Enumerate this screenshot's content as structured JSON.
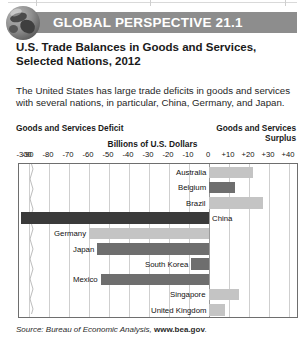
{
  "header": {
    "badge_title": "GLOBAL PERSPECTIVE 21.1",
    "globe_icon": "globe-icon"
  },
  "figure": {
    "title": "U.S. Trade Balances in Goods and Services, Selected Nations, 2012",
    "description": "The United States has large trade deficits in goods and services with several nations, in particular, China, Germany, and Japan.",
    "left_caption": "Goods and Services Deficit",
    "right_caption": "Goods and Services Surplus",
    "source_prefix": "Source: Bureau of Economic Analysis, ",
    "source_link": "www.bea.gov",
    "source_suffix": "."
  },
  "chart_data": {
    "type": "bar",
    "orientation": "horizontal",
    "title": "U.S. Trade Balances in Goods and Services, Selected Nations, 2012",
    "xlabel": "Billions of U.S. Dollars",
    "ylabel": "",
    "grid": true,
    "legend": "none",
    "axis_break": true,
    "axis_break_note": "Axis is broken between -300 and -90",
    "xlim": [
      -300,
      40
    ],
    "tick_labels": [
      "-300",
      "-90",
      "-80",
      "-70",
      "-60",
      "-50",
      "-40",
      "-30",
      "-20",
      "-10",
      "0",
      "+10",
      "+20",
      "+30",
      "+40"
    ],
    "tick_values": [
      -300,
      -90,
      -80,
      -70,
      -60,
      -50,
      -40,
      -30,
      -20,
      -10,
      0,
      10,
      20,
      30,
      40
    ],
    "categories": [
      "Australia",
      "Belgium",
      "Brazil",
      "China",
      "Germany",
      "Japan",
      "South Korea",
      "Mexico",
      "Singapore",
      "United Kingdom"
    ],
    "values": [
      22,
      13,
      27,
      -315,
      -60,
      -56,
      -9,
      -54,
      15,
      8
    ],
    "bar_colors": [
      "#c4c4c4",
      "#6e6e6e",
      "#c4c4c4",
      "#3a3a3a",
      "#c4c4c4",
      "#6e6e6e",
      "#6e6e6e",
      "#6e6e6e",
      "#c4c4c4",
      "#c4c4c4"
    ],
    "label_side": [
      "left",
      "left",
      "left",
      "right",
      "left",
      "left",
      "left",
      "left",
      "left",
      "left"
    ]
  }
}
